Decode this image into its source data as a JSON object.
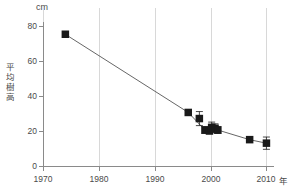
{
  "chart_data": {
    "type": "scatter",
    "title": "",
    "xlabel": "年",
    "ylabel": "平均樹高",
    "unit": "cm",
    "xlim": [
      1970,
      2011
    ],
    "ylim": [
      0,
      82
    ],
    "xticks": [
      1970,
      1980,
      1990,
      2000,
      2010
    ],
    "xtick_labels": [
      "1970",
      "1980",
      "1990",
      "2000",
      "2010"
    ],
    "yticks": [
      0,
      20,
      40,
      60,
      80
    ],
    "ytick_labels": [
      "0",
      "20",
      "40",
      "60",
      "80"
    ],
    "grid": "vertical-only",
    "legend": "none",
    "marker": "filled-square",
    "marker_color": "#1a1a1a",
    "line_color": "#555555",
    "grid_color": "#d8d8d8",
    "axis_color": "#8a8a8a",
    "text_color": "#4a4a4a",
    "series": [
      {
        "name": "平均樹高",
        "points": [
          {
            "x": 1974.0,
            "y": 75.0,
            "err": 0
          },
          {
            "x": 1996.0,
            "y": 30.5,
            "err": 0
          },
          {
            "x": 1998.0,
            "y": 27.0,
            "err": 4.0
          },
          {
            "x": 1999.0,
            "y": 20.5,
            "err": 2.0
          },
          {
            "x": 1999.8,
            "y": 20.0,
            "err": 1.8
          },
          {
            "x": 2000.2,
            "y": 22.0,
            "err": 3.0
          },
          {
            "x": 2000.8,
            "y": 21.5,
            "err": 2.5
          },
          {
            "x": 2001.3,
            "y": 20.5,
            "err": 2.0
          },
          {
            "x": 2007.0,
            "y": 15.0,
            "err": 0
          },
          {
            "x": 2010.0,
            "y": 13.0,
            "err": 3.5
          }
        ]
      }
    ],
    "trend_line_points": [
      {
        "x": 1974.0,
        "y": 75.0
      },
      {
        "x": 1996.0,
        "y": 30.5
      },
      {
        "x": 1999.0,
        "y": 20.5
      },
      {
        "x": 2001.3,
        "y": 20.5
      },
      {
        "x": 2007.0,
        "y": 15.0
      },
      {
        "x": 2010.0,
        "y": 13.0
      }
    ]
  }
}
